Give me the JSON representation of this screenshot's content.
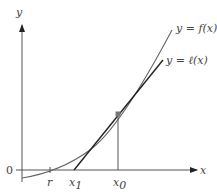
{
  "diagram": {
    "axes": {
      "x_label": "x",
      "y_label": "y",
      "origin_label": "0"
    },
    "curves": {
      "f_label": "y = f(x)",
      "l_label": "y = ℓ(x)"
    },
    "ticks": {
      "r": "r",
      "x1": "x",
      "x1_sub": "1",
      "x0": "x",
      "x0_sub": "0"
    },
    "colors": {
      "curve": "#666666",
      "tangent": "#222222",
      "axis": "#555555",
      "point": "#777777"
    }
  }
}
